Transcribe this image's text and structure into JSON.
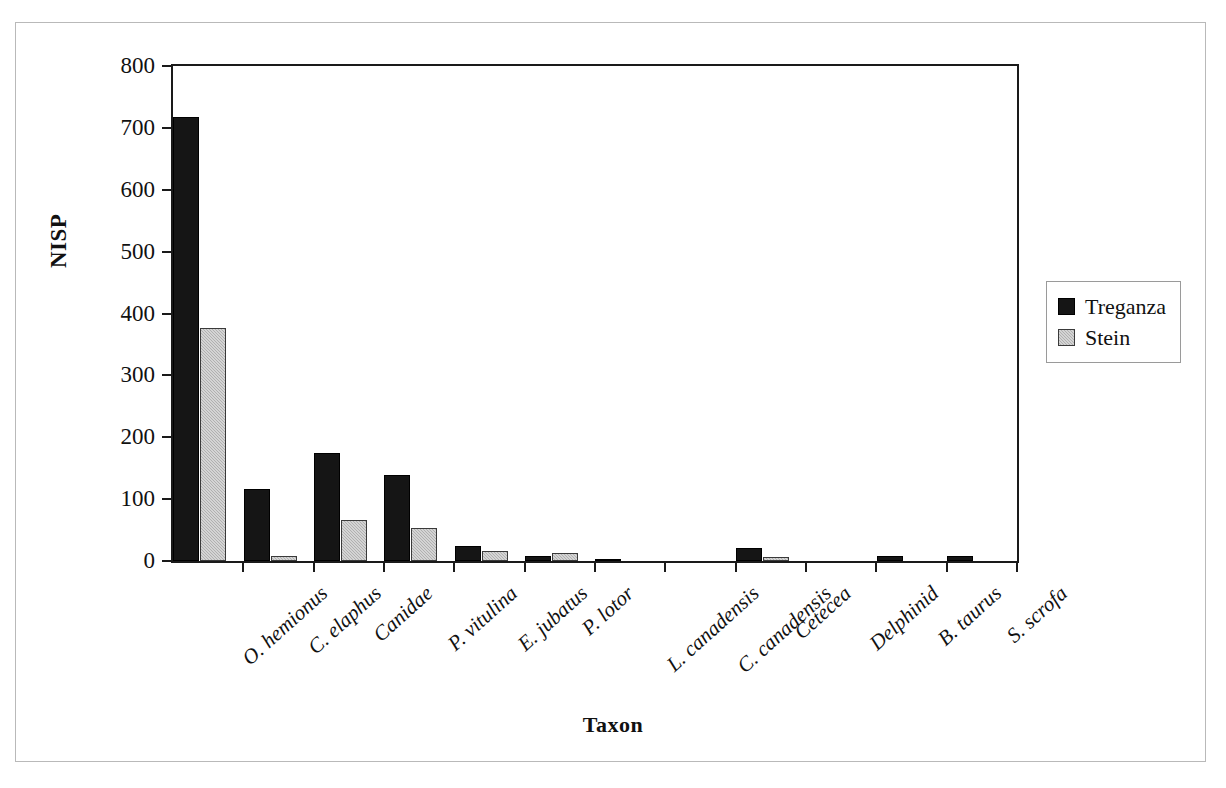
{
  "chart_data": {
    "type": "bar",
    "title": "",
    "xlabel": "Taxon",
    "ylabel": "NISP",
    "ylim": [
      0,
      800
    ],
    "yticks": [
      0,
      100,
      200,
      300,
      400,
      500,
      600,
      700,
      800
    ],
    "grid": false,
    "legend_position": "right",
    "categories": [
      "O. hemionus",
      "C. elaphus",
      "Canidae",
      "P. vitulina",
      "E. jubatus",
      "P. lotor",
      "L. canadensis",
      "C. canadensis",
      "Cetecea",
      "Delphinid",
      "B. taurus",
      "S. scrofa"
    ],
    "series": [
      {
        "name": "Treganza",
        "color": "#151515",
        "values": [
          718,
          116,
          175,
          139,
          25,
          8,
          4,
          0,
          21,
          0,
          8,
          8
        ]
      },
      {
        "name": "Stein",
        "color": "#b0b0b0",
        "values": [
          377,
          8,
          67,
          54,
          16,
          13,
          0,
          0,
          7,
          0,
          0,
          0
        ]
      }
    ]
  },
  "axes": {
    "y_title": "NISP",
    "x_title": "Taxon",
    "y_tick_labels": [
      "0",
      "100",
      "200",
      "300",
      "400",
      "500",
      "600",
      "700",
      "800"
    ]
  },
  "legend": {
    "items": [
      {
        "label": "Treganza",
        "swatch": "black-square-icon"
      },
      {
        "label": "Stein",
        "swatch": "gray-square-icon"
      }
    ]
  }
}
